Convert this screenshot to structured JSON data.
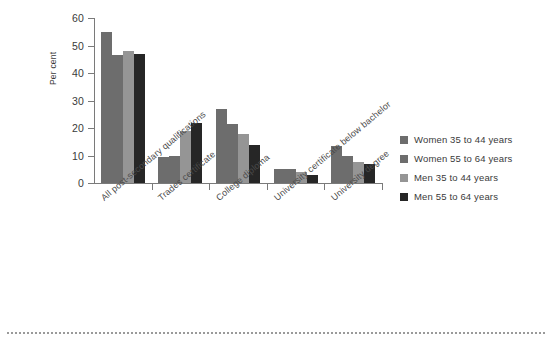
{
  "chart_data": {
    "type": "bar",
    "title": "",
    "subtitle": "",
    "xlabel": "",
    "ylabel": "Per cent",
    "ylim": [
      0,
      60
    ],
    "yticks": [
      0,
      10,
      20,
      30,
      40,
      50,
      60
    ],
    "grid": false,
    "legend_position": "right",
    "categories": [
      "All post-secondary qualifications",
      "Trades certificate",
      "College diploma",
      "University certificate below bachelor",
      "University degree"
    ],
    "series": [
      {
        "name": "Women 35 to 44 years",
        "color": "#6d6d6d",
        "values": [
          55,
          9.5,
          27,
          5,
          13.5
        ]
      },
      {
        "name": "Women 55 to 64 years",
        "color": "#6d6d6d",
        "values": [
          46.5,
          10,
          21.5,
          5,
          10
        ]
      },
      {
        "name": "Men 35 to 44 years",
        "color": "#959595",
        "values": [
          48,
          19,
          18,
          4,
          7.5
        ]
      },
      {
        "name": "Men 55 to 64 years",
        "color": "#262626",
        "values": [
          47,
          22,
          14,
          3,
          7
        ]
      }
    ]
  },
  "axis": {
    "y_title": "Per cent",
    "y_tick_labels": [
      "60",
      "50",
      "40",
      "30",
      "20",
      "10",
      "0"
    ]
  },
  "legend": {
    "items": [
      {
        "label": "Women 35 to 44 years",
        "color": "#6d6d6d"
      },
      {
        "label": "Women 55 to 64 years",
        "color": "#6d6d6d"
      },
      {
        "label": "Men 35 to 44 years",
        "color": "#959595"
      },
      {
        "label": "Men 55 to 64 years",
        "color": "#262626"
      }
    ]
  },
  "colors": {
    "axis": "#7a7a7a",
    "text": "#3a3a3a",
    "rule": "#9a9a9a",
    "background": "#ffffff"
  }
}
